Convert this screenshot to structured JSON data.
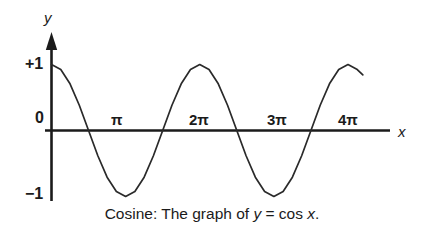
{
  "figure": {
    "caption_prefix": "Cosine: The graph of ",
    "caption_var_y": "y",
    "caption_eq": " = cos ",
    "caption_var_x": "x",
    "caption_period": ".",
    "caption_full": "Cosine: The graph of y = cos x.",
    "line_color": "#1b1b1b",
    "axis_color": "#1b1b1b",
    "background": "#ffffff"
  },
  "axes": {
    "y_axis_label": "y",
    "x_axis_label": "x",
    "y_ticks": [
      {
        "label": "+1",
        "value": 1
      },
      {
        "label": "0",
        "value": 0
      },
      {
        "label": "−1",
        "value": -1
      }
    ],
    "x_ticks": [
      {
        "label": "π",
        "value": 3.14159
      },
      {
        "label": "2π",
        "value": 6.28319
      },
      {
        "label": "3π",
        "value": 9.42478
      },
      {
        "label": "4π",
        "value": 12.56637
      }
    ]
  },
  "chart_data": {
    "type": "line",
    "title": "Cosine: The graph of y = cos x.",
    "xlabel": "x",
    "ylabel": "y",
    "xlim": [
      0,
      13.2
    ],
    "ylim": [
      -1,
      1
    ],
    "grid": false,
    "legend": null,
    "function": "y = cos x",
    "xtick_labels": [
      "π",
      "2π",
      "3π",
      "4π"
    ],
    "xtick_values": [
      3.14159,
      6.28319,
      9.42478,
      12.56637
    ],
    "ytick_labels": [
      "+1",
      "0",
      "−1"
    ],
    "ytick_values": [
      1,
      0,
      -1
    ],
    "series": [
      {
        "name": "cos x",
        "x": [
          0,
          0.3927,
          0.7854,
          1.1781,
          1.5708,
          1.9635,
          2.3562,
          2.7489,
          3.1416,
          3.5343,
          3.927,
          4.3197,
          4.7124,
          5.1051,
          5.4978,
          5.8905,
          6.2832,
          6.6759,
          7.0686,
          7.4613,
          7.854,
          8.2467,
          8.6394,
          9.0321,
          9.4248,
          9.8175,
          10.2102,
          10.6029,
          10.9956,
          11.3883,
          11.781,
          12.1737,
          12.5664,
          12.9591,
          13.1947
        ],
        "y": [
          1.0,
          0.9239,
          0.7071,
          0.3827,
          0.0,
          -0.3827,
          -0.7071,
          -0.9239,
          -1.0,
          -0.9239,
          -0.7071,
          -0.3827,
          0.0,
          0.3827,
          0.7071,
          0.9239,
          1.0,
          0.9239,
          0.7071,
          0.3827,
          0.0,
          -0.3827,
          -0.7071,
          -0.9239,
          -1.0,
          -0.9239,
          -0.7071,
          -0.3827,
          0.0,
          0.3827,
          0.7071,
          0.9239,
          1.0,
          0.9239,
          0.8413
        ]
      }
    ]
  }
}
